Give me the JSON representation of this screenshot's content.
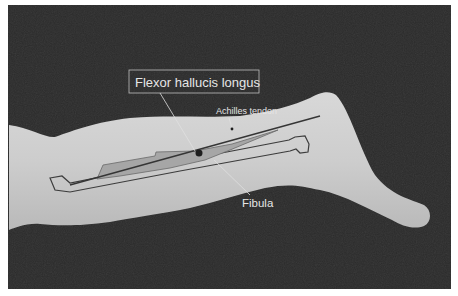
{
  "figure": {
    "labels": {
      "muscle": "Flexor hallucis longus",
      "tendon": "Achilles tendon",
      "bone": "Fibula"
    },
    "colors": {
      "background": "#2a2a2a",
      "skin": "#c9c9c9",
      "outline": "#3a3a3a",
      "muscle_fill": "#a8a8a8",
      "label_text": "#e6e6e6",
      "label_box": "#bdbdbd"
    }
  }
}
